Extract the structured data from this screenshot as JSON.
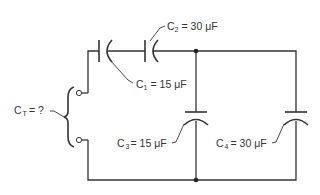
{
  "diagram": {
    "type": "capacitor-circuit",
    "total": {
      "symbol": "C",
      "subscript": "T",
      "value": "= ?"
    },
    "capacitors": [
      {
        "id": "C1",
        "symbol": "C",
        "subscript": "1",
        "value": "= 15 μF",
        "connection": "series"
      },
      {
        "id": "C2",
        "symbol": "C",
        "subscript": "2",
        "value": "= 30 μF",
        "connection": "series"
      },
      {
        "id": "C3",
        "symbol": "C",
        "subscript": "3",
        "value": "= 15 μF",
        "connection": "parallel"
      },
      {
        "id": "C4",
        "symbol": "C",
        "subscript": "4",
        "value": "= 30  μF",
        "connection": "parallel"
      }
    ],
    "colors": {
      "line": "#333333",
      "background": "#ffffff"
    }
  }
}
